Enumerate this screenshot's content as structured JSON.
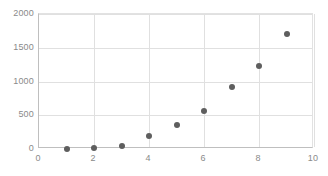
{
  "chart_data": {
    "type": "scatter",
    "title": "",
    "subtitle": "",
    "xlabel": "",
    "ylabel": "",
    "x": [
      1,
      2,
      3,
      4,
      5,
      6,
      7,
      8,
      9
    ],
    "values": [
      0,
      10,
      50,
      195,
      360,
      570,
      925,
      1225,
      1700
    ],
    "series": [
      {
        "name": "",
        "x": [
          1,
          2,
          3,
          4,
          5,
          6,
          7,
          8,
          9
        ],
        "values": [
          0,
          10,
          50,
          195,
          360,
          570,
          925,
          1225,
          1700
        ],
        "marker_color": "#5e5e5e",
        "marker_shape": "circle"
      }
    ],
    "xlim": [
      0,
      10
    ],
    "ylim": [
      0,
      2000
    ],
    "xticks": [
      0,
      2,
      4,
      6,
      8,
      10
    ],
    "yticks": [
      0,
      500,
      1000,
      1500,
      2000
    ],
    "xtick_labels": [
      "0",
      "2",
      "4",
      "6",
      "8",
      "10"
    ],
    "ytick_labels": [
      "0",
      "500",
      "1000",
      "1500",
      "2000"
    ],
    "gridlines": {
      "horizontal": true,
      "vertical": true,
      "color": "#e0e0e0"
    },
    "legend": {
      "visible": false,
      "position": "none",
      "entries": []
    },
    "axis_color": "#bfbfbf",
    "tick_label_color": "#8a8a8a",
    "background": "#ffffff"
  }
}
